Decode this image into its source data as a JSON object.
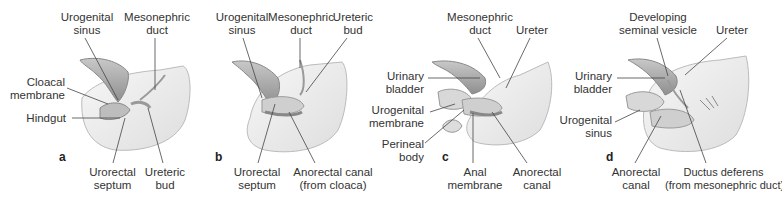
{
  "figure": {
    "panels": [
      {
        "letter": "a",
        "labels": {
          "urogenital_sinus": "Urogenital\nsinus",
          "mesonephric_duct": "Mesonephric\nduct",
          "cloacal_membrane": "Cloacal\nmembrane",
          "hindgut": "Hindgut",
          "urorectal_septum": "Urorectal\nseptum",
          "ureteric_bud": "Ureteric\nbud"
        }
      },
      {
        "letter": "b",
        "labels": {
          "urogenital_sinus": "Urogenital\nsinus",
          "mesonephric_duct": "Mesonephric\nduct",
          "ureteric_bud": "Ureteric\nbud",
          "urorectal_septum": "Urorectal\nseptum",
          "anorectal_canal": "Anorectal canal\n(from cloaca)"
        }
      },
      {
        "letter": "c",
        "labels": {
          "mesonephric_duct": "Mesonephric\nduct",
          "ureter": "Ureter",
          "urinary_bladder": "Urinary\nbladder",
          "urogenital_membrane": "Urogenital\nmembrane",
          "perineal_body": "Perineal\nbody",
          "anal_membrane": "Anal\nmembrane",
          "anorectal_canal": "Anorectal\ncanal"
        }
      },
      {
        "letter": "d",
        "labels": {
          "developing_seminal_vesicle": "Developing\nseminal vesicle",
          "ureter": "Ureter",
          "urinary_bladder": "Urinary\nbladder",
          "urogenital_sinus": "Urogenital\nsinus",
          "anorectal_canal": "Anorectal\ncanal",
          "ductus_deferens": "Ductus deferens\n(from mesonephric duct)"
        }
      }
    ],
    "colors": {
      "body_fill": "#ececec",
      "body_stroke": "#b9b9b9",
      "duct_fill": "#a9a9a9",
      "leader_line": "#444444",
      "text": "#333333"
    }
  }
}
